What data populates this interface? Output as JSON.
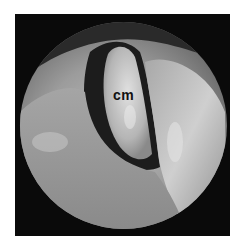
{
  "image": {
    "description": "Endoscopic view inside a circular scope field on black background",
    "label": "cm",
    "colors": {
      "background": "#ffffff",
      "frame": "#0a0a0a",
      "tissue_light": "#d0d0d0",
      "tissue_mid": "#9a9a9a",
      "shadow": "#1a1a1a"
    }
  }
}
